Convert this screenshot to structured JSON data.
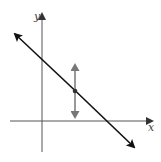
{
  "diagram": {
    "axes": {
      "x_label": "x",
      "y_label": "y"
    },
    "line": {
      "description": "line with negative slope",
      "color": "#111111"
    },
    "point": {
      "description": "point on line with vertical double arrow",
      "arrow_color": "#777777"
    }
  }
}
